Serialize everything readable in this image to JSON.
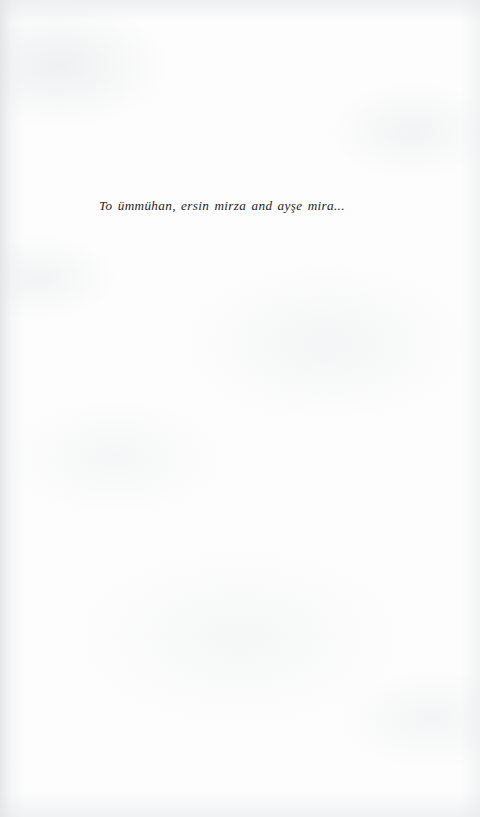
{
  "document": {
    "kind": "book-dedication-page",
    "page_background_color": "#fdfdfd",
    "ink_color": "#232323"
  },
  "dedication": {
    "text": "To ümmühan, ersin mirza and ayşe mira...",
    "parts": {
      "preposition": "To",
      "names": [
        "ümmühan",
        "ersin mirza",
        "ayşe mira"
      ],
      "conjunction": "and",
      "trailing_ellipsis": "..."
    }
  }
}
